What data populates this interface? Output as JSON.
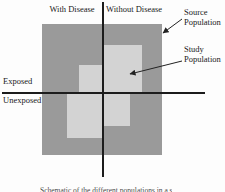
{
  "figure": {
    "columns": {
      "left": "With Disease",
      "right": "Without Disease"
    },
    "rows": {
      "top": "Exposed",
      "bottom": "Unexposed"
    },
    "callouts": {
      "source": "Source Population",
      "study": "Study Population"
    },
    "caption_cropped": "Schematic of the different populations in a study",
    "colors": {
      "source_population_fill": "#9a9a9a",
      "study_population_fill": "#d3d3d3",
      "axis_line": "#1c1c1c",
      "arrow": "#222222",
      "background": "#fdfdfd",
      "text": "#1a1a1a"
    }
  }
}
